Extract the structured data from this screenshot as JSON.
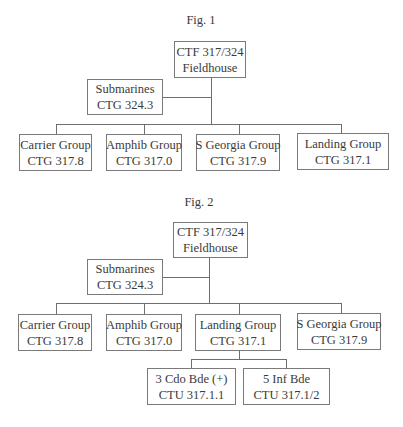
{
  "figures": [
    {
      "label": "Fig. 1",
      "root": {
        "line1": "CTF 317/324",
        "line2": "Fieldhouse"
      },
      "side": {
        "line1": "Submarines",
        "line2": "CTG 324.3"
      },
      "children": [
        {
          "line1": "Carrier Group",
          "line2": "CTG 317.8"
        },
        {
          "line1": "Amphib Group",
          "line2": "CTG 317.0"
        },
        {
          "line1": "S Georgia Group",
          "line2": "CTG 317.9"
        },
        {
          "line1": "Landing Group",
          "line2": "CTG 317.1"
        }
      ]
    },
    {
      "label": "Fig. 2",
      "root": {
        "line1": "CTF 317/324",
        "line2": "Fieldhouse"
      },
      "side": {
        "line1": "Submarines",
        "line2": "CTG 324.3"
      },
      "children": [
        {
          "line1": "Carrier Group",
          "line2": "CTG 317.8"
        },
        {
          "line1": "Amphib Group",
          "line2": "CTG 317.0"
        },
        {
          "line1": "Landing Group",
          "line2": "CTG 317.1"
        },
        {
          "line1": "S Georgia Group",
          "line2": "CTG 317.9"
        }
      ],
      "subunits": [
        {
          "line1": "3 Cdo Bde (+)",
          "line2": "CTU 317.1.1"
        },
        {
          "line1": "5 Inf Bde",
          "line2": "CTU 317.1/2"
        }
      ]
    }
  ]
}
